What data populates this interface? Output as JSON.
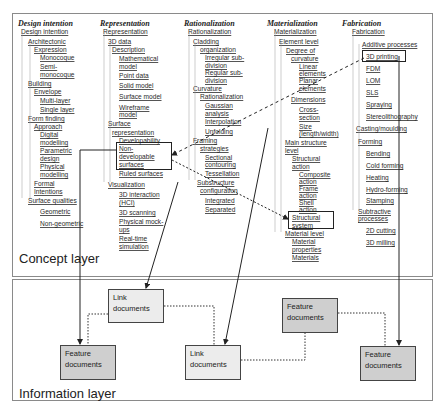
{
  "concept_layer": {
    "label": "Concept layer",
    "columns": [
      {
        "heading": "Design intention",
        "nodes": [
          {
            "text": "Design intention",
            "x": 21,
            "y": 28
          },
          {
            "text": "Architectonic",
            "x": 28,
            "y": 38
          },
          {
            "text": "Expression",
            "x": 34,
            "y": 46
          },
          {
            "text": "Monocoque",
            "x": 40,
            "y": 54
          },
          {
            "text": "Semi-",
            "x": 40,
            "y": 63
          },
          {
            "text": "monocoque",
            "x": 40,
            "y": 71
          },
          {
            "text": "Building",
            "x": 28,
            "y": 80
          },
          {
            "text": "Envelope",
            "x": 34,
            "y": 88
          },
          {
            "text": "Multi-layer",
            "x": 40,
            "y": 97
          },
          {
            "text": "Single layer",
            "x": 40,
            "y": 106
          },
          {
            "text": "Form finding",
            "x": 28,
            "y": 115
          },
          {
            "text": "Approach",
            "x": 34,
            "y": 123
          },
          {
            "text": "Digital",
            "x": 40,
            "y": 131
          },
          {
            "text": "modelling",
            "x": 40,
            "y": 139
          },
          {
            "text": "Parametric",
            "x": 40,
            "y": 147
          },
          {
            "text": "design",
            "x": 40,
            "y": 155
          },
          {
            "text": "Physical",
            "x": 40,
            "y": 163
          },
          {
            "text": "modelling",
            "x": 40,
            "y": 171
          },
          {
            "text": "Formal",
            "x": 34,
            "y": 180
          },
          {
            "text": "Intentions",
            "x": 34,
            "y": 188
          },
          {
            "text": "Surface qualities",
            "x": 28,
            "y": 197
          },
          {
            "text": "Geometric",
            "x": 40,
            "y": 208
          },
          {
            "text": "Non-geometric",
            "x": 40,
            "y": 220
          }
        ]
      },
      {
        "heading": "Representation",
        "nodes": [
          {
            "text": "Representation",
            "x": 103,
            "y": 28
          },
          {
            "text": "3D data",
            "x": 108,
            "y": 38
          },
          {
            "text": "Description",
            "x": 112,
            "y": 46
          },
          {
            "text": "Mathematical",
            "x": 119,
            "y": 55
          },
          {
            "text": "model",
            "x": 119,
            "y": 63
          },
          {
            "text": "Point data",
            "x": 119,
            "y": 72
          },
          {
            "text": "Solid model",
            "x": 119,
            "y": 82
          },
          {
            "text": "Surface model",
            "x": 119,
            "y": 93
          },
          {
            "text": "Wireframe",
            "x": 119,
            "y": 104
          },
          {
            "text": "model",
            "x": 119,
            "y": 111
          },
          {
            "text": "Surface",
            "x": 108,
            "y": 120
          },
          {
            "text": "representation",
            "x": 112,
            "y": 129
          },
          {
            "text": "Developability",
            "x": 119,
            "y": 137
          },
          {
            "text": "Non-",
            "x": 119,
            "y": 145
          },
          {
            "text": "developable",
            "x": 119,
            "y": 153
          },
          {
            "text": "surfaces",
            "x": 119,
            "y": 161
          },
          {
            "text": "Ruled surfaces",
            "x": 119,
            "y": 170
          },
          {
            "text": "Visualization",
            "x": 108,
            "y": 181
          },
          {
            "text": "3D interaction",
            "x": 119,
            "y": 191
          },
          {
            "text": "(HCI)",
            "x": 119,
            "y": 199
          },
          {
            "text": "3D scanning",
            "x": 119,
            "y": 209
          },
          {
            "text": "Physical mock-",
            "x": 119,
            "y": 218
          },
          {
            "text": "ups",
            "x": 119,
            "y": 226
          },
          {
            "text": "Real-time",
            "x": 119,
            "y": 235
          },
          {
            "text": "simulation",
            "x": 119,
            "y": 243
          }
        ]
      },
      {
        "heading": "Rationalization",
        "nodes": [
          {
            "text": "Rationalization",
            "x": 188,
            "y": 28
          },
          {
            "text": "Cladding",
            "x": 193,
            "y": 38
          },
          {
            "text": "organization",
            "x": 200,
            "y": 46
          },
          {
            "text": "Irregular sub-",
            "x": 205,
            "y": 54
          },
          {
            "text": "division",
            "x": 205,
            "y": 62
          },
          {
            "text": "Regular sub-",
            "x": 205,
            "y": 69
          },
          {
            "text": "division",
            "x": 205,
            "y": 77
          },
          {
            "text": "Curvature",
            "x": 193,
            "y": 85
          },
          {
            "text": "Rationalization",
            "x": 200,
            "y": 93
          },
          {
            "text": "Gaussian",
            "x": 205,
            "y": 102
          },
          {
            "text": "analysis",
            "x": 205,
            "y": 110
          },
          {
            "text": "Interpolation",
            "x": 205,
            "y": 118
          },
          {
            "text": "Unfolding",
            "x": 205,
            "y": 128
          },
          {
            "text": "Framing",
            "x": 193,
            "y": 137
          },
          {
            "text": "strategies",
            "x": 200,
            "y": 145
          },
          {
            "text": "Sectional",
            "x": 205,
            "y": 154
          },
          {
            "text": "contouring",
            "x": 205,
            "y": 161
          },
          {
            "text": "Tessellation",
            "x": 205,
            "y": 170
          },
          {
            "text": "Substructure",
            "x": 197,
            "y": 179
          },
          {
            "text": "configuration",
            "x": 200,
            "y": 187
          },
          {
            "text": "Integrated",
            "x": 205,
            "y": 197
          },
          {
            "text": "Separated",
            "x": 205,
            "y": 206
          }
        ]
      },
      {
        "heading": "Materialization",
        "nodes": [
          {
            "text": "Materialization",
            "x": 274,
            "y": 28
          },
          {
            "text": "Element level",
            "x": 279,
            "y": 38
          },
          {
            "text": "Degree of",
            "x": 286,
            "y": 47
          },
          {
            "text": "curvature",
            "x": 291,
            "y": 55
          },
          {
            "text": "Linear",
            "x": 299,
            "y": 63
          },
          {
            "text": "elements",
            "x": 299,
            "y": 70
          },
          {
            "text": "Planar",
            "x": 299,
            "y": 77
          },
          {
            "text": "elements",
            "x": 299,
            "y": 85
          },
          {
            "text": "Dimensions",
            "x": 291,
            "y": 96
          },
          {
            "text": "Cross-",
            "x": 299,
            "y": 106
          },
          {
            "text": "section",
            "x": 299,
            "y": 114
          },
          {
            "text": "Size",
            "x": 299,
            "y": 123
          },
          {
            "text": "(length/width)",
            "x": 299,
            "y": 130
          },
          {
            "text": "Main structure",
            "x": 285,
            "y": 139
          },
          {
            "text": "level",
            "x": 285,
            "y": 147
          },
          {
            "text": "Structural",
            "x": 292,
            "y": 155
          },
          {
            "text": "action",
            "x": 292,
            "y": 163
          },
          {
            "text": "Composite",
            "x": 299,
            "y": 171
          },
          {
            "text": "action",
            "x": 299,
            "y": 178
          },
          {
            "text": "Frame",
            "x": 299,
            "y": 185
          },
          {
            "text": "action",
            "x": 299,
            "y": 192
          },
          {
            "text": "Shell",
            "x": 299,
            "y": 199
          },
          {
            "text": "action",
            "x": 299,
            "y": 206
          },
          {
            "text": "Structural",
            "x": 292,
            "y": 214
          },
          {
            "text": "system",
            "x": 292,
            "y": 222
          },
          {
            "text": "Material level",
            "x": 285,
            "y": 230
          },
          {
            "text": "Material",
            "x": 292,
            "y": 238
          },
          {
            "text": "properties",
            "x": 292,
            "y": 246
          },
          {
            "text": "Materials",
            "x": 292,
            "y": 254
          }
        ]
      },
      {
        "heading": "Fabrication",
        "nodes": [
          {
            "text": "Fabrication",
            "x": 352,
            "y": 28
          },
          {
            "text": "Additive processes",
            "x": 362,
            "y": 41
          },
          {
            "text": "3D printing",
            "x": 366,
            "y": 53
          },
          {
            "text": "FDM",
            "x": 366,
            "y": 65
          },
          {
            "text": "LOM",
            "x": 366,
            "y": 77
          },
          {
            "text": "SLS",
            "x": 366,
            "y": 89
          },
          {
            "text": "Spraying",
            "x": 366,
            "y": 101
          },
          {
            "text": "Stereolithography",
            "x": 366,
            "y": 113
          },
          {
            "text": "Casting/moulding",
            "x": 356,
            "y": 125
          },
          {
            "text": "Forming",
            "x": 358,
            "y": 138
          },
          {
            "text": "Bending",
            "x": 366,
            "y": 150
          },
          {
            "text": "Cold forming",
            "x": 366,
            "y": 162
          },
          {
            "text": "Heating",
            "x": 366,
            "y": 174
          },
          {
            "text": "Hydro-forming",
            "x": 366,
            "y": 186
          },
          {
            "text": "Stamping",
            "x": 366,
            "y": 197
          },
          {
            "text": "Subtractive",
            "x": 358,
            "y": 208
          },
          {
            "text": "processes",
            "x": 358,
            "y": 215
          },
          {
            "text": "2D cutting",
            "x": 366,
            "y": 227
          },
          {
            "text": "3D milling",
            "x": 366,
            "y": 239
          }
        ]
      }
    ],
    "highlighted": [
      "Non-developable surfaces",
      "Structural system",
      "3D printing"
    ]
  },
  "information_layer": {
    "label": "Information layer",
    "boxes": [
      {
        "type": "link",
        "line1": "Link",
        "line2": "documents"
      },
      {
        "type": "feature",
        "line1": "Feature",
        "line2": "documents"
      },
      {
        "type": "link",
        "line1": "Link",
        "line2": "documents"
      },
      {
        "type": "feature",
        "line1": "Feature",
        "line2": "documents"
      },
      {
        "type": "feature",
        "line1": "Feature",
        "line2": "documents"
      }
    ]
  },
  "colors": {
    "link_box": "#ececec",
    "feature_box": "#cfcfcf",
    "line": "#222222",
    "border": "#8a8a8a"
  }
}
